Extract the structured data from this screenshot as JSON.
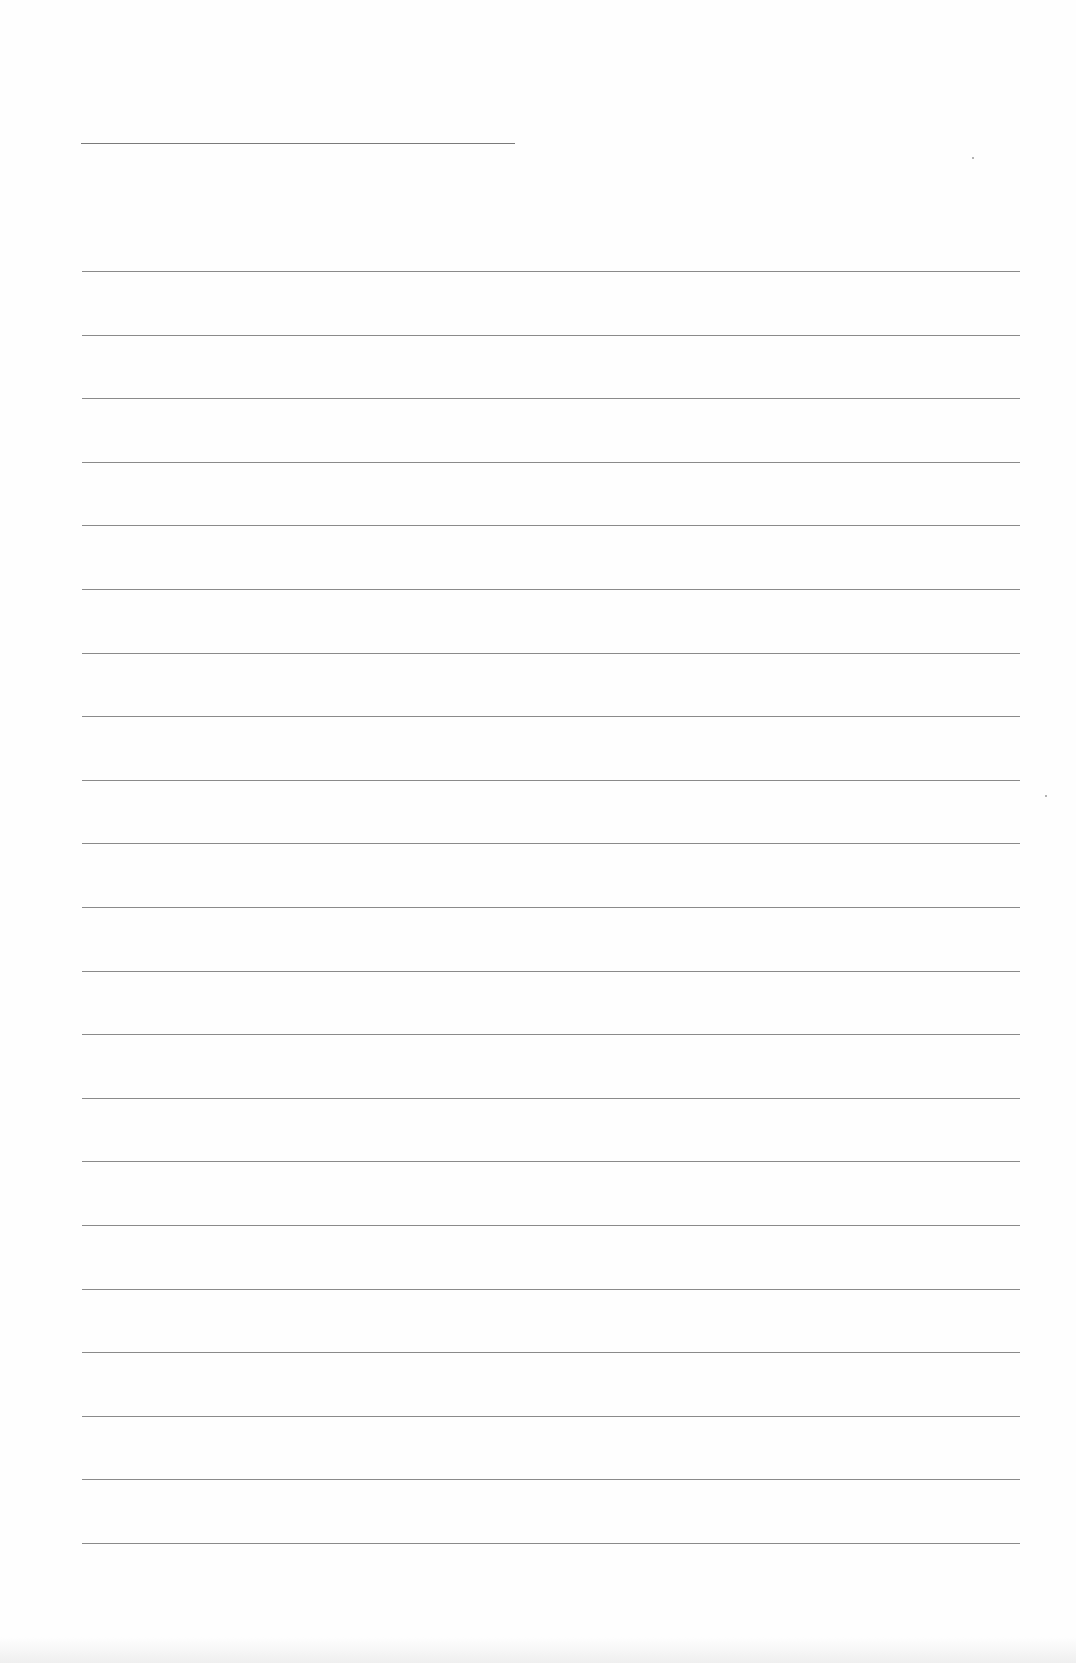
{
  "document": {
    "type": "lined-paper",
    "title_line": {
      "present": true,
      "text": ""
    },
    "rule_count": 21,
    "rules_first_y": 271,
    "rules_spacing": 63.6,
    "lines": [
      "",
      "",
      "",
      "",
      "",
      "",
      "",
      "",
      "",
      "",
      "",
      "",
      "",
      "",
      "",
      "",
      "",
      "",
      "",
      "",
      ""
    ],
    "colors": {
      "paper": "#fefefe",
      "rule": "#8a8a8a"
    }
  }
}
